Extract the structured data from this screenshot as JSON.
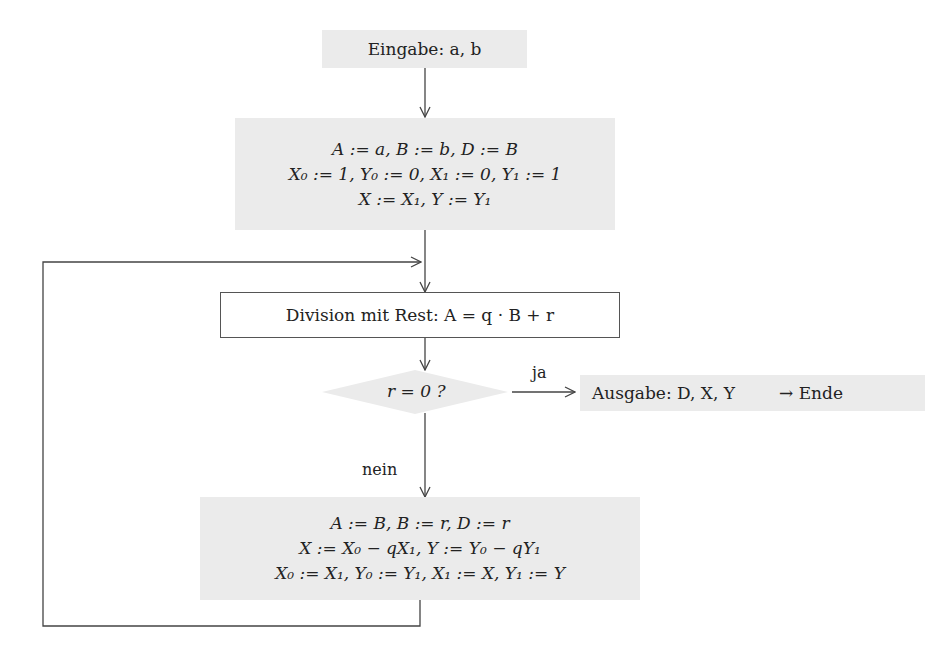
{
  "flowchart": {
    "input": {
      "label": "Eingabe: a, b"
    },
    "init": {
      "lines": [
        "A := a, B := b, D := B",
        "X₀ := 1, Y₀ := 0, X₁ := 0, Y₁ := 1",
        "X := X₁, Y := Y₁"
      ]
    },
    "division": {
      "label": "Division mit Rest: A = q · B + r"
    },
    "decision": {
      "label": "r = 0 ?"
    },
    "yes_label": "ja",
    "no_label": "nein",
    "output": {
      "label": "Ausgabe: D, X, Y",
      "end": "→ Ende"
    },
    "update": {
      "lines": [
        "A := B, B := r, D := r",
        "X := X₀ − qX₁, Y := Y₀ − qY₁",
        "X₀ := X₁, Y₀ := Y₁, X₁ := X, Y₁ := Y"
      ]
    },
    "colors": {
      "box_fill": "#ebebeb",
      "line": "#444444"
    }
  }
}
